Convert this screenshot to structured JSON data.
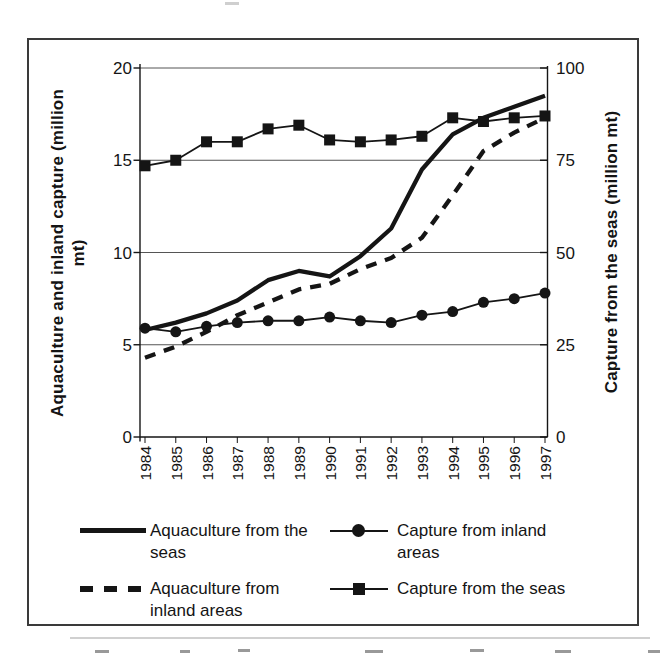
{
  "chart_data": {
    "type": "line",
    "x": [
      "1984",
      "1985",
      "1986",
      "1987",
      "1988",
      "1989",
      "1990",
      "1991",
      "1992",
      "1993",
      "1994",
      "1995",
      "1996",
      "1997"
    ],
    "series": [
      {
        "name": "Aquaculture from the seas",
        "axis": "left",
        "style": "solid-thick",
        "values": [
          5.8,
          6.2,
          6.7,
          7.4,
          8.5,
          9.0,
          8.7,
          9.8,
          11.3,
          14.5,
          16.4,
          17.3,
          17.9,
          18.5
        ]
      },
      {
        "name": "Aquaculture from inland areas",
        "axis": "left",
        "style": "dashed-thick",
        "values": [
          4.3,
          4.9,
          5.7,
          6.6,
          7.3,
          8.0,
          8.3,
          9.1,
          9.7,
          10.8,
          13.1,
          15.5,
          16.5,
          17.3
        ]
      },
      {
        "name": "Capture from inland areas",
        "axis": "left",
        "style": "thin-circle",
        "values": [
          5.9,
          5.7,
          6.0,
          6.2,
          6.3,
          6.3,
          6.5,
          6.3,
          6.2,
          6.6,
          6.8,
          7.3,
          7.5,
          7.8
        ]
      },
      {
        "name": "Capture from the seas",
        "axis": "right",
        "style": "thin-square",
        "values": [
          73.5,
          75,
          80,
          80,
          83.5,
          84.5,
          80.5,
          80,
          80.5,
          81.5,
          86.5,
          85.5,
          86.5,
          87
        ]
      }
    ],
    "left_axis": {
      "label": "Aquaculture and inland capture (million mt)",
      "label_lines": [
        "Aquaculture and inland capture (million",
        "mt)"
      ],
      "ticks": [
        "0",
        "5",
        "10",
        "15",
        "20"
      ],
      "range": [
        0,
        20
      ]
    },
    "right_axis": {
      "label": "Capture from the seas (million mt)",
      "ticks": [
        "0",
        "25",
        "50",
        "75",
        "100"
      ],
      "range": [
        0,
        100
      ]
    },
    "grid": true,
    "legend_position": "bottom",
    "ink_color": "#151515",
    "grid_color": "#555555"
  }
}
